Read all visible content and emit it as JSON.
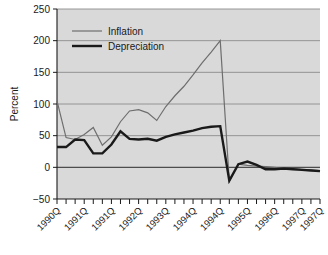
{
  "chart_data": {
    "type": "line",
    "title": "",
    "subtitle": "",
    "xlabel": "",
    "ylabel": "Percent",
    "ylim": [
      -50,
      250
    ],
    "yticks": [
      -50,
      0,
      50,
      100,
      150,
      200,
      250
    ],
    "ytick_labels": [
      "−50",
      "0",
      "50",
      "100",
      "150",
      "200",
      "250"
    ],
    "grid": true,
    "grid_axis": "y",
    "legend_position": "top-left-inside",
    "plot_background": "#d9d9d9",
    "x": [
      "1990Q1",
      "1990Q2",
      "1990Q3",
      "1990Q4",
      "1991Q1",
      "1991Q2",
      "1991Q3",
      "1991Q4",
      "1992Q1",
      "1992Q2",
      "1992Q3",
      "1992Q4",
      "1993Q1",
      "1993Q2",
      "1993Q3",
      "1993Q4",
      "1994Q1",
      "1994Q2",
      "1994Q3",
      "1994Q4",
      "1995Q1",
      "1995Q2",
      "1995Q3",
      "1995Q4",
      "1996Q1",
      "1996Q2",
      "1996Q3",
      "1996Q4",
      "1997Q1",
      "1997Q2"
    ],
    "xtick_labels": [
      "1990Q",
      "1991Q",
      "1991Q",
      "1992Q",
      "1993Q",
      "1994Q",
      "1994Q",
      "1995Q",
      "1996Q",
      "1997Q",
      "1997Q"
    ],
    "xtick_label_positions": [
      0,
      3,
      6,
      9,
      12,
      15,
      18,
      21,
      24,
      27,
      29
    ],
    "series": [
      {
        "name": "Inflation",
        "color": "#6e6e6e",
        "width": 1.2,
        "values": [
          105,
          47,
          44,
          52,
          63,
          35,
          48,
          72,
          89,
          91,
          86,
          74,
          96,
          113,
          128,
          146,
          165,
          182,
          200,
          -22,
          5,
          3,
          2,
          1,
          0,
          -2,
          -2,
          -3,
          -4,
          -5
        ]
      },
      {
        "name": "Depreciation",
        "color": "#1a1a1a",
        "width": 2.4,
        "values": [
          32,
          32,
          44,
          43,
          22,
          22,
          36,
          57,
          45,
          44,
          45,
          42,
          48,
          52,
          55,
          58,
          62,
          64,
          65,
          -21,
          5,
          9,
          4,
          -3,
          -3,
          -2,
          -3,
          -4,
          -5,
          -6
        ]
      }
    ]
  },
  "legend": {
    "entries": [
      {
        "label": "Inflation",
        "color": "#6e6e6e"
      },
      {
        "label": "Depreciation",
        "color": "#1a1a1a"
      }
    ]
  }
}
